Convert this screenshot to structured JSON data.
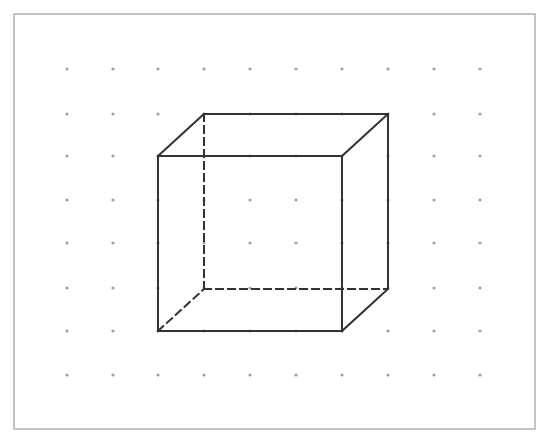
{
  "diagram": {
    "type": "dot-grid-cube",
    "frame": {
      "x": 14,
      "y": 14,
      "width": 521,
      "height": 415,
      "stroke": "#b0b0b0"
    },
    "grid": {
      "columns_x": [
        67,
        113,
        158,
        204,
        250,
        296,
        342,
        388,
        434,
        480
      ],
      "rows_y": [
        69,
        114,
        156,
        200,
        243,
        288,
        331,
        375
      ],
      "dot_color": "#a0a0a0",
      "dot_radius": 1.6
    },
    "cube": {
      "stroke": "#333333",
      "front_face": {
        "x1": 158,
        "y1": 156,
        "x2": 342,
        "y2": 331
      },
      "back_face": {
        "x1": 204,
        "y1": 114,
        "x2": 388,
        "y2": 289
      },
      "solid_edges": [
        [
          158,
          156,
          342,
          156
        ],
        [
          342,
          156,
          342,
          331
        ],
        [
          342,
          331,
          158,
          331
        ],
        [
          158,
          331,
          158,
          156
        ],
        [
          204,
          114,
          388,
          114
        ],
        [
          388,
          114,
          388,
          289
        ],
        [
          158,
          156,
          204,
          114
        ],
        [
          342,
          156,
          388,
          114
        ],
        [
          342,
          331,
          388,
          289
        ]
      ],
      "hidden_edges": [
        [
          204,
          114,
          204,
          289
        ],
        [
          204,
          289,
          388,
          289
        ],
        [
          158,
          331,
          204,
          289
        ]
      ]
    }
  }
}
